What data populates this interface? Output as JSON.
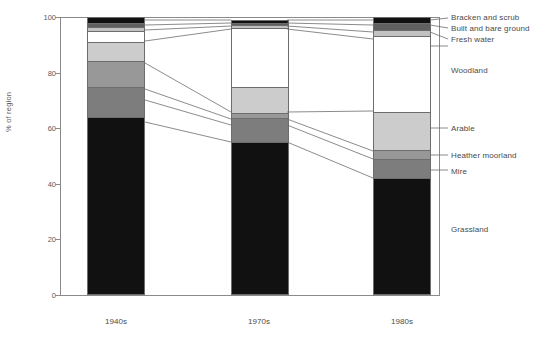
{
  "chart_data": {
    "type": "bar",
    "subtype": "stacked-100-percent",
    "title": "",
    "xlabel": "",
    "ylabel": "% of region",
    "ylim": [
      0,
      100
    ],
    "yticks": [
      0,
      20,
      40,
      60,
      80,
      100
    ],
    "grid": false,
    "legend_position": "right-outside-labels",
    "categories": [
      "1940s",
      "1970s",
      "1980s"
    ],
    "series": [
      {
        "name": "Grassland",
        "values": [
          64.0,
          55.0,
          42.0
        ],
        "color": "#111111"
      },
      {
        "name": "Mire",
        "values": [
          11.0,
          8.5,
          7.0
        ],
        "color": "#7d7d7d"
      },
      {
        "name": "Heather moorland",
        "values": [
          9.0,
          2.0,
          3.0
        ],
        "color": "#989898"
      },
      {
        "name": "Arable",
        "values": [
          7.0,
          9.5,
          14.0
        ],
        "color": "#cccccc"
      },
      {
        "name": "Woodland",
        "values": [
          4.0,
          21.0,
          27.0
        ],
        "color": "#ffffff"
      },
      {
        "name": "Fresh water",
        "values": [
          1.5,
          1.0,
          2.5
        ],
        "color": "#c2c2c2"
      },
      {
        "name": "Built and bare ground",
        "values": [
          1.5,
          1.0,
          2.5
        ],
        "color": "#606060"
      },
      {
        "name": "Bracken and scrub",
        "values": [
          2.0,
          1.0,
          2.0
        ],
        "color": "#111111"
      }
    ]
  },
  "axis": {
    "ylabel": "% of region",
    "tick_100": "100",
    "tick_80": "80",
    "tick_60": "60",
    "tick_40": "40",
    "tick_20": "20",
    "tick_0": "0"
  },
  "x_labels": {
    "b1": "1940s",
    "b2": "1970s",
    "b3": "1980s"
  },
  "legend": {
    "bracken": "Bracken and scrub",
    "built": "Built and bare ground",
    "freshwater": "Fresh water",
    "woodland": "Woodland",
    "arable": "Arable",
    "heather": "Heather moorland",
    "mire": "Mire",
    "grassland": "Grassland"
  }
}
